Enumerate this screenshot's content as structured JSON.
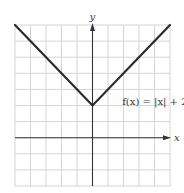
{
  "chart_data": {
    "type": "line",
    "title": "",
    "xlabel": "x",
    "ylabel": "y",
    "xlim": [
      -5,
      5
    ],
    "ylim": [
      -3,
      7
    ],
    "grid": true,
    "grid_step": 1,
    "series": [
      {
        "name": "f(x) = |x| + 2",
        "x": [
          -5,
          0,
          5
        ],
        "y": [
          7,
          2,
          7
        ],
        "color": "#2b2b2b"
      }
    ],
    "annotations": [
      {
        "text": "f(x) = |x| + 2",
        "x": 2.3,
        "y": 2.3
      }
    ]
  }
}
